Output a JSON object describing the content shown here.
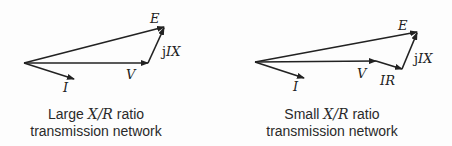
{
  "diagrams": [
    {
      "name": "large-xr",
      "caption_line1_pre": "Large ",
      "caption_ratio": "X/R",
      "caption_line1_post": " ratio",
      "caption_line2": "transmission network",
      "labels": {
        "E": "E",
        "V": "V",
        "I": "I",
        "jIX_j": "j",
        "jIX": "IX"
      }
    },
    {
      "name": "small-xr",
      "caption_line1_pre": "Small ",
      "caption_ratio": "X/R",
      "caption_line1_post": " ratio",
      "caption_line2": "transmission network",
      "labels": {
        "E": "E",
        "V": "V",
        "I": "I",
        "IR": "IR",
        "jIX_j": "j",
        "jIX": "IX"
      }
    }
  ],
  "colors": {
    "stroke": "#222222",
    "text": "#2a2a2a"
  }
}
